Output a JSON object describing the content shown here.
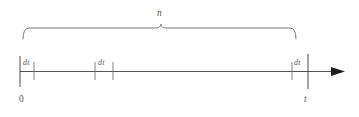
{
  "figure": {
    "background_color": "#ffffff",
    "line_color": "#545454",
    "text_color": "#555555",
    "width": 359,
    "height": 117
  },
  "brace": {
    "label": "n",
    "label_x": 157,
    "label_y": 9,
    "start_x": 23,
    "end_x": 296,
    "apex_x": 161,
    "top_y": 28,
    "tip_y": 39,
    "apex_y": 24
  },
  "axis": {
    "y": 71.5,
    "start_x": 20,
    "end_x": 345,
    "arrow_tip_x": 345,
    "arrow_back_x": 331,
    "arrow_half_height": 4.5
  },
  "ticks": [
    {
      "name": "origin-tick",
      "x": 20,
      "top": 56,
      "bottom": 87,
      "tall": true
    },
    {
      "name": "first-interval-tick",
      "x": 34,
      "top": 62,
      "bottom": 80,
      "tall": false
    },
    {
      "name": "middle-interval-tick-left",
      "x": 95,
      "top": 62,
      "bottom": 80,
      "tall": false
    },
    {
      "name": "middle-interval-tick-right",
      "x": 113,
      "top": 62,
      "bottom": 80,
      "tall": false
    },
    {
      "name": "last-interval-tick",
      "x": 292,
      "top": 62,
      "bottom": 80,
      "tall": false
    },
    {
      "name": "endpoint-tick",
      "x": 308,
      "top": 54,
      "bottom": 89,
      "tall": true
    }
  ],
  "interval_labels": [
    {
      "name": "dt-label-first",
      "text": "dt",
      "x": 23,
      "y": 59
    },
    {
      "name": "dt-label-middle",
      "text": "dt",
      "x": 98,
      "y": 59
    },
    {
      "name": "dt-label-last",
      "text": "dt",
      "x": 294,
      "y": 59
    }
  ],
  "endpoints": [
    {
      "name": "origin-label",
      "text": "0",
      "x": 19,
      "y": 95
    },
    {
      "name": "end-time-label",
      "text": "t",
      "x": 304,
      "y": 95
    }
  ]
}
